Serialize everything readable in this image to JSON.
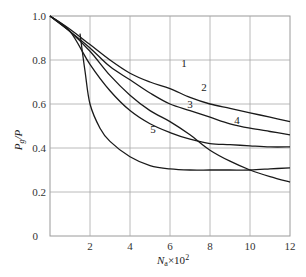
{
  "chart_data": {
    "type": "line",
    "title": "",
    "xlabel": "N_a × 10^2",
    "ylabel": "P_g/P",
    "xlim": [
      0,
      12
    ],
    "ylim": [
      0,
      1.0
    ],
    "grid": true,
    "legend": "inline curve labels",
    "x_ticks": [
      "2",
      "4",
      "6",
      "8",
      "10",
      "12"
    ],
    "y_ticks": [
      "0",
      "0.2",
      "0.4",
      "0.6",
      "0.8",
      "1.0"
    ],
    "series": [
      {
        "name": "1",
        "points": [
          [
            0,
            1.0
          ],
          [
            1,
            0.94
          ],
          [
            2,
            0.87
          ],
          [
            3,
            0.8
          ],
          [
            4,
            0.74
          ],
          [
            5,
            0.7
          ],
          [
            6,
            0.67
          ],
          [
            7,
            0.63
          ],
          [
            8,
            0.6
          ],
          [
            9,
            0.58
          ],
          [
            10,
            0.56
          ],
          [
            11,
            0.54
          ],
          [
            12,
            0.52
          ]
        ],
        "label_pos": [
          6.7,
          0.77
        ]
      },
      {
        "name": "2",
        "points": [
          [
            0,
            1.0
          ],
          [
            1,
            0.93
          ],
          [
            2,
            0.855
          ],
          [
            3,
            0.77
          ],
          [
            4,
            0.71
          ],
          [
            5,
            0.65
          ],
          [
            6,
            0.6
          ],
          [
            7,
            0.57
          ],
          [
            8,
            0.54
          ],
          [
            9,
            0.51
          ],
          [
            10,
            0.49
          ],
          [
            11,
            0.475
          ],
          [
            12,
            0.46
          ]
        ],
        "label_pos": [
          7.7,
          0.66
        ]
      },
      {
        "name": "3",
        "points": [
          [
            0,
            1.0
          ],
          [
            1,
            0.93
          ],
          [
            2,
            0.84
          ],
          [
            3,
            0.73
          ],
          [
            4,
            0.64
          ],
          [
            5,
            0.57
          ],
          [
            6,
            0.52
          ],
          [
            7,
            0.46
          ],
          [
            8,
            0.39
          ],
          [
            9,
            0.34
          ],
          [
            10,
            0.3
          ],
          [
            11,
            0.27
          ],
          [
            12,
            0.245
          ]
        ],
        "label_pos": [
          7.0,
          0.58
        ]
      },
      {
        "name": "4",
        "points": [
          [
            0,
            1.0
          ],
          [
            1,
            0.93
          ],
          [
            2,
            0.78
          ],
          [
            3,
            0.66
          ],
          [
            4,
            0.57
          ],
          [
            5,
            0.51
          ],
          [
            6,
            0.47
          ],
          [
            7,
            0.44
          ],
          [
            8,
            0.42
          ],
          [
            9,
            0.415
          ],
          [
            10,
            0.41
          ],
          [
            11,
            0.405
          ],
          [
            12,
            0.405
          ]
        ],
        "label_pos": [
          9.35,
          0.51
        ]
      },
      {
        "name": "5",
        "points": [
          [
            1.5,
            0.92
          ],
          [
            1.75,
            0.75
          ],
          [
            2,
            0.6
          ],
          [
            2.5,
            0.49
          ],
          [
            3,
            0.43
          ],
          [
            4,
            0.36
          ],
          [
            5,
            0.32
          ],
          [
            6,
            0.305
          ],
          [
            7,
            0.3
          ],
          [
            8,
            0.3
          ],
          [
            9,
            0.3
          ],
          [
            10,
            0.3
          ],
          [
            11,
            0.305
          ],
          [
            12,
            0.31
          ]
        ],
        "label_pos": [
          5.15,
          0.47
        ]
      }
    ]
  },
  "axes": {
    "xlabel_main": "N",
    "xlabel_sub": "a",
    "xlabel_rest": "×10",
    "xlabel_sup": "2",
    "ylabel_main": "P",
    "ylabel_sub": "g",
    "ylabel_rest": "/P"
  }
}
